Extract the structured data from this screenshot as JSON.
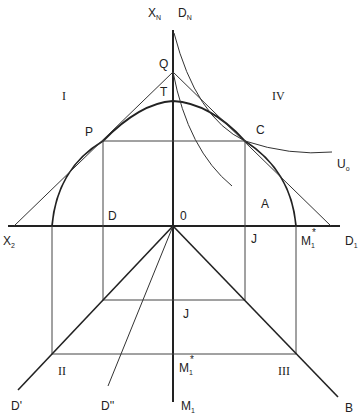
{
  "diagram": {
    "axes": {
      "vertical_top_left": "X",
      "vertical_top_left_sub": "N",
      "vertical_top_right": "D",
      "vertical_top_right_sub": "N",
      "vertical_bottom": "M",
      "vertical_bottom_sub": "1",
      "horizontal_left": "X",
      "horizontal_left_sub": "2",
      "horizontal_right": "D",
      "horizontal_right_sub": "1"
    },
    "quadrants": {
      "q1": "I",
      "q2": "II",
      "q3": "III",
      "q4": "IV"
    },
    "points": {
      "Q": "Q",
      "T": "T",
      "P": "P",
      "C": "C",
      "A": "A",
      "D": "D",
      "O": "0",
      "J_right": "J",
      "J_lower": "J",
      "M1star_axis": "M",
      "M1star_axis_sub": "1",
      "M1star_axis_sup": "*",
      "M1star_lower": "M",
      "M1star_lower_sub": "1",
      "M1star_lower_sup": "*"
    },
    "curves": {
      "U0": "U",
      "U0_sub": "o",
      "D_prime": "D'",
      "D_double_prime": "D''",
      "B": "B"
    }
  }
}
